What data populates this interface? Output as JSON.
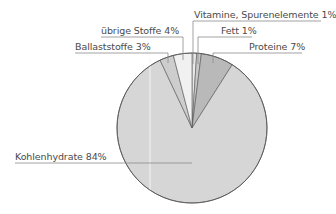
{
  "chart_data": {
    "type": "pie",
    "title": "",
    "start_angle_deg": 0,
    "direction": "clockwise",
    "slices": [
      {
        "label": "Vitamine, Spurenelemente",
        "value": 1,
        "display": "Vitamine, Spurenelemente 1%",
        "color": "#e8e8e8"
      },
      {
        "label": "Fett",
        "value": 1,
        "display": "Fett 1%",
        "color": "#c8c8c8"
      },
      {
        "label": "Proteine",
        "value": 7,
        "display": "Proteine 7%",
        "color": "#b9b9b9"
      },
      {
        "label": "Kohlenhydrate",
        "value": 84,
        "display": "Kohlenhydrate 84%",
        "color": "#d6d6d6"
      },
      {
        "label": "Ballaststoffe",
        "value": 3,
        "display": "Ballaststoffe 3%",
        "color": "#cdcdcd"
      },
      {
        "label": "übrige Stoffe",
        "value": 4,
        "display": "übrige Stoffe 4%",
        "color": "#f1f1f1"
      }
    ],
    "categories": [
      "Vitamine, Spurenelemente",
      "Fett",
      "Proteine",
      "Kohlenhydrate",
      "Ballaststoffe",
      "übrige Stoffe"
    ],
    "values": [
      1,
      1,
      7,
      84,
      3,
      4
    ],
    "units": "%",
    "legend": "none (leader-line labels)"
  },
  "labels": {
    "vitamine": "Vitamine, Spurenelemente 1%",
    "fett": "Fett 1%",
    "proteine": "Proteine 7%",
    "kohlenhydrate": "Kohlenhydrate 84%",
    "ballaststoffe": "Ballaststoffe 3%",
    "uebrige": "übrige Stoffe 4%"
  }
}
